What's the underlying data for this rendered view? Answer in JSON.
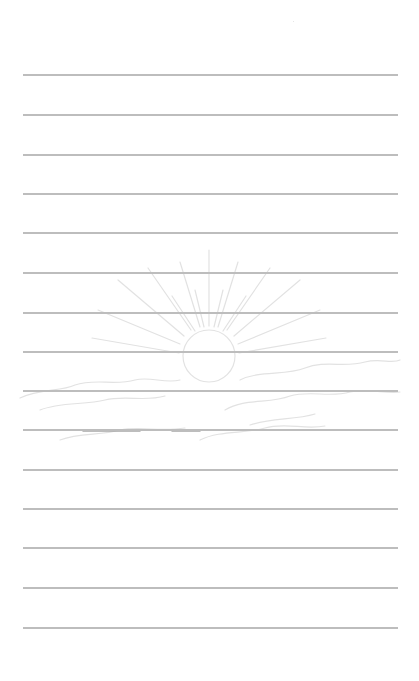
{
  "page": {
    "type": "lined-notebook-page",
    "background_color": "#ffffff",
    "rule_color": "#bdbdbd",
    "rule_count": 15,
    "rule_left": 23,
    "rule_right": 398,
    "rule_positions_y": [
      75,
      115,
      155,
      194,
      233,
      273,
      313,
      352,
      391,
      430,
      470,
      509,
      548,
      588,
      628
    ]
  },
  "watermark": {
    "icon": "sunrise-icon",
    "description": "faint sun with radiating rays rising over clouds",
    "color": "#e4e4e4",
    "sun_center": [
      209,
      356
    ],
    "sun_radius": 26
  }
}
